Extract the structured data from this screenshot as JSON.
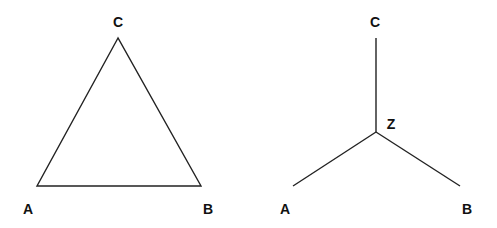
{
  "colors": {
    "line": "#222222",
    "label": "#111111",
    "background": "#ffffff"
  },
  "diagrams": [
    {
      "name": "delta-triangle",
      "type": "triangle",
      "nodes": [
        {
          "id": "C",
          "label": "C",
          "x": 118,
          "y": 38
        },
        {
          "id": "A",
          "label": "A",
          "x": 37,
          "y": 186
        },
        {
          "id": "B",
          "label": "B",
          "x": 201,
          "y": 186
        }
      ],
      "edges": [
        [
          "A",
          "B"
        ],
        [
          "B",
          "C"
        ],
        [
          "C",
          "A"
        ]
      ]
    },
    {
      "name": "wye-star",
      "type": "star",
      "nodes": [
        {
          "id": "C",
          "label": "C",
          "x": 376,
          "y": 38
        },
        {
          "id": "Z",
          "label": "Z",
          "x": 376,
          "y": 132
        },
        {
          "id": "A",
          "label": "A",
          "x": 293,
          "y": 186
        },
        {
          "id": "B",
          "label": "B",
          "x": 460,
          "y": 186
        }
      ],
      "edges": [
        [
          "Z",
          "C"
        ],
        [
          "Z",
          "A"
        ],
        [
          "Z",
          "B"
        ]
      ]
    }
  ]
}
